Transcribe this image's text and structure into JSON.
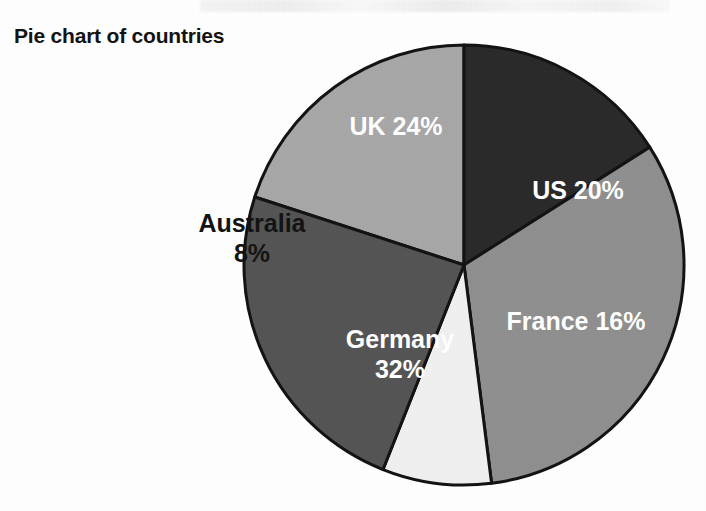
{
  "page": {
    "background_color": "#ffffff",
    "width": 706,
    "height": 511
  },
  "chart_title": "Pie chart of countries",
  "chart_data": {
    "type": "pie",
    "title": "Pie chart of countries",
    "xlabel": "",
    "ylabel": "",
    "categories": [
      "US",
      "France",
      "Germany",
      "Australia",
      "UK"
    ],
    "values": [
      20,
      16,
      32,
      8,
      24
    ],
    "units": "%",
    "total": 100,
    "legend_position": "none",
    "labels_inside_slices": true,
    "start_angle_deg": -72,
    "direction": "clockwise",
    "center": [
      464,
      265
    ],
    "radius": 220,
    "slices": [
      {
        "name": "US",
        "value": 20,
        "label": "US 20%",
        "label_line1": "US 20%",
        "label_line2": "",
        "color": "#a8a8a8",
        "text_color": "#ffffff",
        "label_x": 578,
        "label_y": 192
      },
      {
        "name": "France",
        "value": 16,
        "label": "France 16%",
        "label_line1": "France 16%",
        "label_line2": "",
        "color": "#2b2b2b",
        "text_color": "#ffffff",
        "label_x": 576,
        "label_y": 323
      },
      {
        "name": "Germany",
        "value": 32,
        "label": "Germany 32%",
        "label_line1": "Germany",
        "label_line2": "32%",
        "color": "#909090",
        "text_color": "#ffffff",
        "label_x": 400,
        "label_y": 356
      },
      {
        "name": "Australia",
        "value": 8,
        "label": "Australia 8%",
        "label_line1": "Australia",
        "label_line2": "8%",
        "color": "#f0f0f0",
        "text_color": "#141414",
        "label_x": 310,
        "label_y": 240
      },
      {
        "name": "UK",
        "value": 24,
        "label": "UK 24%",
        "label_line1": "UK 24%",
        "label_line2": "",
        "color": "#555555",
        "text_color": "#ffffff",
        "label_x": 396,
        "label_y": 128
      }
    ],
    "stroke_color": "#141414",
    "stroke_width": 3
  }
}
